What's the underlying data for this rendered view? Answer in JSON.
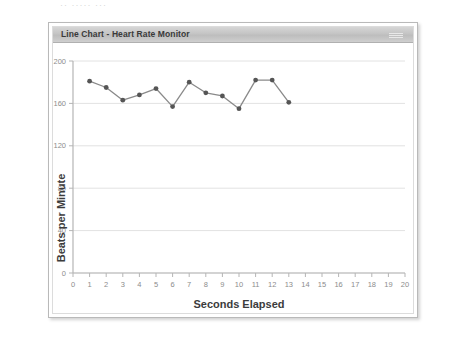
{
  "top_artifact": "·· ·····  ···",
  "panel": {
    "titlebar": {
      "text": "Line Chart - Heart Rate Monitor",
      "grip_icon": "drag-grip-icon"
    }
  },
  "chart_data": {
    "type": "line",
    "title": "Line Chart - Heart Rate Monitor",
    "xlabel": "Seconds Elapsed",
    "ylabel": "Beats per Minute",
    "x": [
      1,
      2,
      3,
      4,
      5,
      6,
      7,
      8,
      9,
      10,
      11,
      12,
      13
    ],
    "values": [
      181,
      175,
      163,
      168,
      174,
      157,
      180,
      170,
      167,
      155,
      182,
      182,
      161
    ],
    "series": [
      {
        "name": "Heart Rate",
        "values": [
          181,
          175,
          163,
          168,
          174,
          157,
          180,
          170,
          167,
          155,
          182,
          182,
          161
        ]
      }
    ],
    "xlim": [
      0,
      20
    ],
    "ylim": [
      0,
      200
    ],
    "xticks": [
      0,
      1,
      2,
      3,
      4,
      5,
      6,
      7,
      8,
      9,
      10,
      11,
      12,
      13,
      14,
      15,
      16,
      17,
      18,
      19,
      20
    ],
    "xtick_labels": [
      "0",
      "1",
      "2",
      "3",
      "4",
      "5",
      "6",
      "7",
      "8",
      "9",
      "10",
      "11",
      "12",
      "13",
      "14",
      "15",
      "16",
      "17",
      "18",
      "19",
      "20"
    ],
    "yticks": [
      0,
      40,
      80,
      120,
      160,
      200
    ],
    "ytick_labels": [
      "0",
      "40",
      "80",
      "120",
      "160",
      "200"
    ],
    "grid": true,
    "grid_axis": "y",
    "legend": false,
    "marker": "circle",
    "colors": {
      "line": "#8a8a8a",
      "marker": "#555555",
      "grid": "#e2e2e2",
      "axis": "#b5b5b5",
      "tick_label": "#8c8c8c",
      "axis_title": "#3c3c3c",
      "titlebar_text": "#3a3a3a",
      "panel_border": "#b9b9b9",
      "background": "#ffffff"
    }
  }
}
